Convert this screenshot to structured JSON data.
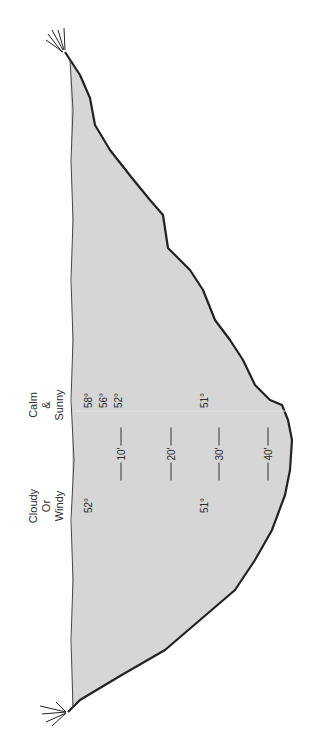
{
  "diagram": {
    "fill_color": "#d6d6d6",
    "outline_color": "#222222",
    "conditions": [
      {
        "id": "calm",
        "lines": [
          "Calm",
          "&",
          "Sunny"
        ]
      },
      {
        "id": "cloudy",
        "lines": [
          "Cloudy",
          "Or",
          "Windy"
        ]
      }
    ],
    "temperatures": {
      "calm": [
        "58°",
        "56°",
        "52°",
        "51°"
      ],
      "cloudy": [
        "52°",
        "51°"
      ]
    },
    "depth_markers": [
      "10'",
      "20'",
      "30'",
      "40'"
    ]
  }
}
